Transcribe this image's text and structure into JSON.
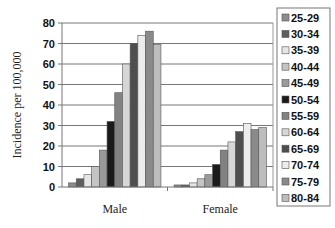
{
  "chart_data": {
    "type": "bar",
    "title": "",
    "xlabel": "",
    "ylabel": "Incidence per 100,000",
    "ylim": [
      0,
      80
    ],
    "yticks": [
      0,
      10,
      20,
      30,
      40,
      50,
      60,
      70,
      80
    ],
    "grid": true,
    "legend_position": "right",
    "categories": [
      "Male",
      "Female"
    ],
    "series": [
      {
        "name": "25-29",
        "color": "#8c8c8c",
        "values": [
          2,
          1
        ]
      },
      {
        "name": "30-34",
        "color": "#5e5e5e",
        "values": [
          4,
          1
        ]
      },
      {
        "name": "35-39",
        "color": "#e6e6e6",
        "values": [
          6,
          2
        ]
      },
      {
        "name": "40-44",
        "color": "#c4c4c4",
        "values": [
          10,
          4
        ]
      },
      {
        "name": "45-49",
        "color": "#9a9a9a",
        "values": [
          18,
          6
        ]
      },
      {
        "name": "50-54",
        "color": "#1a1a1a",
        "values": [
          32,
          11
        ]
      },
      {
        "name": "55-59",
        "color": "#828282",
        "values": [
          46,
          18
        ]
      },
      {
        "name": "60-64",
        "color": "#d6d6d6",
        "values": [
          60,
          22
        ]
      },
      {
        "name": "65-69",
        "color": "#4e4e4e",
        "values": [
          70,
          27
        ]
      },
      {
        "name": "70-74",
        "color": "#ececec",
        "values": [
          74,
          31
        ]
      },
      {
        "name": "75-79",
        "color": "#8a8a8a",
        "values": [
          76,
          28
        ]
      },
      {
        "name": "80-84",
        "color": "#bdbdbd",
        "values": [
          69.5,
          29
        ]
      }
    ]
  }
}
